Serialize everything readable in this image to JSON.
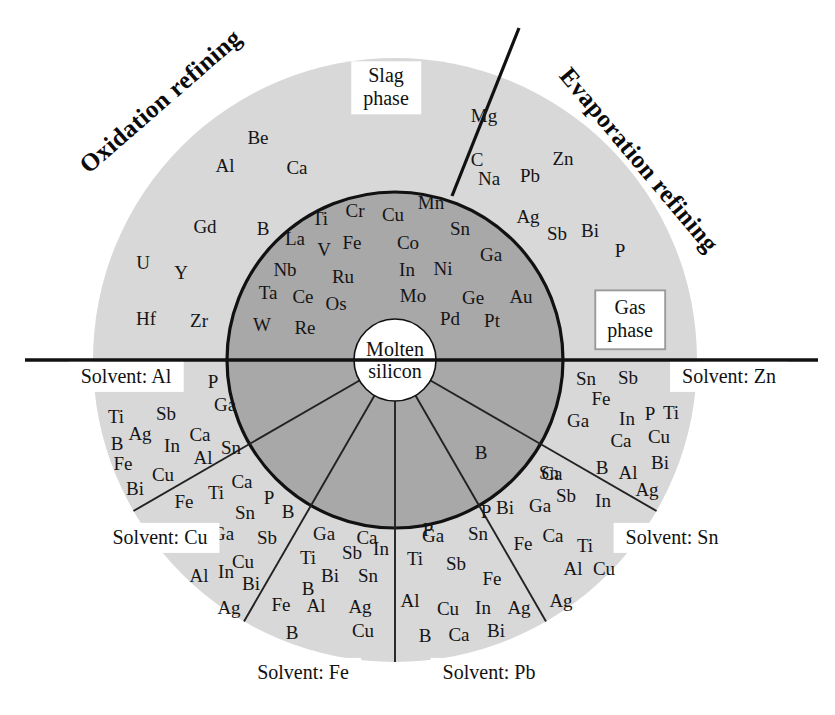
{
  "figure": {
    "title_left": "Oxidation refining",
    "title_right": "Evaporation refining",
    "center_label": "Molten\nsilicon",
    "colors": {
      "outer_ring": "#d8d8d8",
      "inner_disc": "#a8a8a8",
      "center_disc": "#ffffff",
      "stroke": "#111111",
      "thin_stroke": "#222222",
      "label_box_border": "#9a9a9a",
      "background": "#ffffff"
    },
    "geometry": {
      "cx": 395,
      "cy": 360,
      "outer_radius": 302,
      "inner_radius": 168,
      "center_radius": 41
    }
  },
  "phase_labels": [
    {
      "name": "slag-phase",
      "text": "Slag\nphase",
      "framed": false,
      "x": 386,
      "y": 88
    },
    {
      "name": "gas-phase",
      "text": "Gas\nphase",
      "framed": true,
      "x": 630,
      "y": 320
    }
  ],
  "solvent_labels": [
    {
      "name": "solvent-al",
      "text": "Solvent: Al",
      "x": 126,
      "y": 377
    },
    {
      "name": "solvent-cu",
      "text": "Solvent: Cu",
      "x": 160,
      "y": 538
    },
    {
      "name": "solvent-fe",
      "text": "Solvent: Fe",
      "x": 303,
      "y": 673
    },
    {
      "name": "solvent-pb",
      "text": "Solvent: Pb",
      "x": 489,
      "y": 673
    },
    {
      "name": "solvent-sn",
      "text": "Solvent: Sn",
      "x": 672,
      "y": 538
    },
    {
      "name": "solvent-zn",
      "text": "Solvent: Zn",
      "x": 729,
      "y": 377
    }
  ],
  "regions": {
    "slag_phase_outer_left": {
      "label": "Slag phase (oxidation refining, outer light ring, upper-left)",
      "elements": [
        {
          "s": "Be",
          "x": 258,
          "y": 137
        },
        {
          "s": "Al",
          "x": 225,
          "y": 165
        },
        {
          "s": "Ca",
          "x": 297,
          "y": 167
        },
        {
          "s": "Gd",
          "x": 205,
          "y": 226
        },
        {
          "s": "B",
          "x": 263,
          "y": 228
        },
        {
          "s": "U",
          "x": 143,
          "y": 262
        },
        {
          "s": "Y",
          "x": 181,
          "y": 272
        },
        {
          "s": "Hf",
          "x": 146,
          "y": 318
        },
        {
          "s": "Zr",
          "x": 199,
          "y": 320
        }
      ]
    },
    "gas_phase_outer_right": {
      "label": "Gas phase (evaporation refining, outer light ring, upper-right)",
      "elements": [
        {
          "s": "Mg",
          "x": 484,
          "y": 115
        },
        {
          "s": "C",
          "x": 477,
          "y": 159
        },
        {
          "s": "Zn",
          "x": 563,
          "y": 158
        },
        {
          "s": "Na",
          "x": 489,
          "y": 178
        },
        {
          "s": "Pb",
          "x": 530,
          "y": 175
        },
        {
          "s": "Ag",
          "x": 528,
          "y": 216
        },
        {
          "s": "Sb",
          "x": 557,
          "y": 233
        },
        {
          "s": "Bi",
          "x": 590,
          "y": 230
        },
        {
          "s": "P",
          "x": 620,
          "y": 250
        }
      ]
    },
    "molten_silicon_upper_left": {
      "label": "Molten silicon (inner dark disc, upper-left)",
      "elements": [
        {
          "s": "Ti",
          "x": 320,
          "y": 218
        },
        {
          "s": "Cr",
          "x": 355,
          "y": 210
        },
        {
          "s": "Cu",
          "x": 393,
          "y": 214
        },
        {
          "s": "Mn",
          "x": 431,
          "y": 202
        },
        {
          "s": "La",
          "x": 295,
          "y": 238
        },
        {
          "s": "V",
          "x": 324,
          "y": 249
        },
        {
          "s": "Fe",
          "x": 352,
          "y": 242
        },
        {
          "s": "Co",
          "x": 408,
          "y": 242
        },
        {
          "s": "Sn",
          "x": 460,
          "y": 228
        },
        {
          "s": "Nb",
          "x": 285,
          "y": 269
        },
        {
          "s": "Ru",
          "x": 343,
          "y": 276
        },
        {
          "s": "In",
          "x": 407,
          "y": 269
        },
        {
          "s": "Ni",
          "x": 443,
          "y": 268
        },
        {
          "s": "Ga",
          "x": 491,
          "y": 254
        },
        {
          "s": "Ta",
          "x": 268,
          "y": 292
        },
        {
          "s": "Ce",
          "x": 303,
          "y": 296
        },
        {
          "s": "Os",
          "x": 336,
          "y": 303
        },
        {
          "s": "Mo",
          "x": 413,
          "y": 295
        },
        {
          "s": "Ge",
          "x": 473,
          "y": 297
        },
        {
          "s": "Au",
          "x": 521,
          "y": 296
        },
        {
          "s": "W",
          "x": 262,
          "y": 324
        },
        {
          "s": "Re",
          "x": 305,
          "y": 327
        },
        {
          "s": "Pd",
          "x": 450,
          "y": 318
        },
        {
          "s": "Pt",
          "x": 492,
          "y": 320
        }
      ]
    },
    "sector_al_inner": {
      "label": "Solvent Al — inner dark sector",
      "elements": [
        {
          "s": "P",
          "x": 213,
          "y": 381
        },
        {
          "s": "Ga",
          "x": 225,
          "y": 404
        }
      ]
    },
    "sector_fe_inner": {
      "label": "Solvent Fe — inner dark sector",
      "elements": [
        {
          "s": "Ca",
          "x": 367,
          "y": 537
        }
      ]
    },
    "sector_pb_inner": {
      "label": "Solvent Pb — inner dark sector",
      "elements": [
        {
          "s": "P",
          "x": 428,
          "y": 529
        }
      ]
    },
    "sector_sn_inner": {
      "label": "Solvent Sn — inner dark sector",
      "elements": [
        {
          "s": "B",
          "x": 481,
          "y": 452
        },
        {
          "s": "P",
          "x": 486,
          "y": 511
        }
      ]
    },
    "sector_zn_inner": {
      "label": "Solvent Zn — inner dark sector",
      "elements": [
        {
          "s": "Ca",
          "x": 552,
          "y": 473
        }
      ]
    },
    "sector_al_outer": {
      "label": "Solvent Al — outer light sector",
      "elements": [
        {
          "s": "Ti",
          "x": 116,
          "y": 416
        },
        {
          "s": "Sb",
          "x": 166,
          "y": 413
        },
        {
          "s": "Ag",
          "x": 140,
          "y": 433
        },
        {
          "s": "Ca",
          "x": 200,
          "y": 434
        },
        {
          "s": "B",
          "x": 117,
          "y": 443
        },
        {
          "s": "In",
          "x": 172,
          "y": 445
        },
        {
          "s": "Al",
          "x": 203,
          "y": 457
        },
        {
          "s": "Sn",
          "x": 231,
          "y": 447
        },
        {
          "s": "Fe",
          "x": 123,
          "y": 463
        },
        {
          "s": "Cu",
          "x": 163,
          "y": 474
        },
        {
          "s": "Bi",
          "x": 135,
          "y": 488
        },
        {
          "s": "Fe",
          "x": 184,
          "y": 501
        }
      ]
    },
    "sector_cu_outer": {
      "label": "Solvent Cu — outer light sector",
      "elements": [
        {
          "s": "Ti",
          "x": 216,
          "y": 492
        },
        {
          "s": "Ca",
          "x": 242,
          "y": 481
        },
        {
          "s": "P",
          "x": 269,
          "y": 497
        },
        {
          "s": "Sn",
          "x": 245,
          "y": 512
        },
        {
          "s": "B",
          "x": 288,
          "y": 511
        },
        {
          "s": "Ga",
          "x": 223,
          "y": 533
        },
        {
          "s": "Sb",
          "x": 267,
          "y": 537
        },
        {
          "s": "Cu",
          "x": 243,
          "y": 561
        },
        {
          "s": "Al",
          "x": 199,
          "y": 575
        },
        {
          "s": "In",
          "x": 226,
          "y": 571
        },
        {
          "s": "Bi",
          "x": 251,
          "y": 583
        },
        {
          "s": "Ag",
          "x": 229,
          "y": 607
        }
      ]
    },
    "sector_fe_outer": {
      "label": "Solvent Fe — outer light sector",
      "elements": [
        {
          "s": "Ga",
          "x": 324,
          "y": 533
        },
        {
          "s": "Ti",
          "x": 308,
          "y": 557
        },
        {
          "s": "Sb",
          "x": 352,
          "y": 552
        },
        {
          "s": "In",
          "x": 381,
          "y": 548
        },
        {
          "s": "Bi",
          "x": 330,
          "y": 575
        },
        {
          "s": "Sn",
          "x": 368,
          "y": 575
        },
        {
          "s": "B",
          "x": 308,
          "y": 588
        },
        {
          "s": "Fe",
          "x": 281,
          "y": 604
        },
        {
          "s": "Al",
          "x": 316,
          "y": 605
        },
        {
          "s": "Ag",
          "x": 360,
          "y": 606
        },
        {
          "s": "B",
          "x": 292,
          "y": 632
        },
        {
          "s": "Cu",
          "x": 363,
          "y": 630
        }
      ]
    },
    "sector_pb_outer": {
      "label": "Solvent Pb — outer light sector",
      "elements": [
        {
          "s": "Ga",
          "x": 433,
          "y": 535
        },
        {
          "s": "Sn",
          "x": 478,
          "y": 533
        },
        {
          "s": "Ti",
          "x": 415,
          "y": 558
        },
        {
          "s": "Sb",
          "x": 456,
          "y": 563
        },
        {
          "s": "Fe",
          "x": 492,
          "y": 578
        },
        {
          "s": "Al",
          "x": 410,
          "y": 600
        },
        {
          "s": "Cu",
          "x": 448,
          "y": 608
        },
        {
          "s": "In",
          "x": 483,
          "y": 607
        },
        {
          "s": "Ag",
          "x": 519,
          "y": 607
        },
        {
          "s": "B",
          "x": 425,
          "y": 635
        },
        {
          "s": "Ca",
          "x": 459,
          "y": 634
        },
        {
          "s": "Bi",
          "x": 496,
          "y": 630
        }
      ]
    },
    "sector_sn_outer": {
      "label": "Solvent Sn — outer light sector",
      "elements": [
        {
          "s": "Sn",
          "x": 549,
          "y": 472
        },
        {
          "s": "Sb",
          "x": 566,
          "y": 495
        },
        {
          "s": "Bi",
          "x": 505,
          "y": 507
        },
        {
          "s": "Ga",
          "x": 540,
          "y": 505
        },
        {
          "s": "In",
          "x": 603,
          "y": 500
        },
        {
          "s": "Fe",
          "x": 523,
          "y": 543
        },
        {
          "s": "Ca",
          "x": 553,
          "y": 535
        },
        {
          "s": "Ti",
          "x": 585,
          "y": 545
        },
        {
          "s": "Al",
          "x": 573,
          "y": 568
        },
        {
          "s": "Cu",
          "x": 604,
          "y": 568
        },
        {
          "s": "Ag",
          "x": 561,
          "y": 600
        }
      ]
    },
    "sector_zn_outer": {
      "label": "Solvent Zn — outer light sector",
      "elements": [
        {
          "s": "Sn",
          "x": 586,
          "y": 378
        },
        {
          "s": "Sb",
          "x": 628,
          "y": 377
        },
        {
          "s": "Fe",
          "x": 601,
          "y": 398
        },
        {
          "s": "Ga",
          "x": 578,
          "y": 420
        },
        {
          "s": "In",
          "x": 627,
          "y": 418
        },
        {
          "s": "P",
          "x": 650,
          "y": 413
        },
        {
          "s": "Ti",
          "x": 671,
          "y": 412
        },
        {
          "s": "Ca",
          "x": 621,
          "y": 440
        },
        {
          "s": "Cu",
          "x": 659,
          "y": 436
        },
        {
          "s": "B",
          "x": 602,
          "y": 467
        },
        {
          "s": "Al",
          "x": 628,
          "y": 472
        },
        {
          "s": "Bi",
          "x": 660,
          "y": 462
        },
        {
          "s": "Ag",
          "x": 647,
          "y": 489
        }
      ]
    }
  }
}
